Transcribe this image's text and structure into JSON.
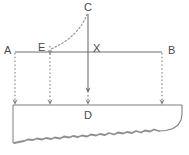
{
  "diagram": {
    "background_color": "#ffffff",
    "line_color": "#6e6e6e",
    "dotted_color": "#8a8a8a",
    "label_color": "#4a4a4a",
    "water_fill": "#ffffff",
    "seabed_color": "#8c8c8c",
    "labels": {
      "a": "A",
      "b": "B",
      "c": "C",
      "d": "D",
      "e": "E",
      "x": "X"
    },
    "points": {
      "a": {
        "x": 15,
        "y": 52
      },
      "b": {
        "x": 162,
        "y": 52
      },
      "c": {
        "x": 88,
        "y": 14
      },
      "d": {
        "x": 88,
        "y": 105
      },
      "e": {
        "x": 50,
        "y": 52
      },
      "x": {
        "x": 88,
        "y": 52
      }
    },
    "elements": [
      {
        "name": "horizontal-line-ab",
        "type": "solid-line",
        "from": "A",
        "to": "B"
      },
      {
        "name": "vertical-line-cx",
        "type": "solid-arrow",
        "from": "C",
        "to": "below-X"
      },
      {
        "name": "arc-c-to-e",
        "type": "dotted-arc",
        "from": "C",
        "to": "E"
      },
      {
        "name": "drop-line-a",
        "type": "dotted-arrow",
        "x": 15
      },
      {
        "name": "drop-line-e",
        "type": "dotted-arrow",
        "x": 50
      },
      {
        "name": "drop-line-x",
        "type": "dotted-arrow",
        "x": 88
      },
      {
        "name": "drop-line-b",
        "type": "dotted-arrow",
        "x": 162
      },
      {
        "name": "water-surface",
        "type": "solid-line",
        "y": 105
      },
      {
        "name": "seabed",
        "type": "jagged-line"
      }
    ]
  }
}
